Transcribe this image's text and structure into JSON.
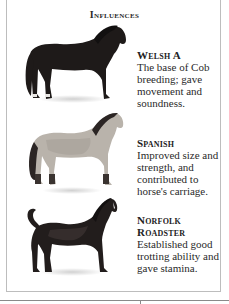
{
  "page": {
    "title": "Influences"
  },
  "influences": [
    {
      "name": "Welsh A",
      "description": "The base of Cob breeding; gave movement and soundness.",
      "coat_color": "#1e1a19"
    },
    {
      "name": "Spanish",
      "description": "Improved size and strength, and contributed to horse's carriage.",
      "coat_color": "#b9b3ab"
    },
    {
      "name": "Norfolk Roadster",
      "description": "Established good trotting ability and gave stamina.",
      "coat_color": "#221d1c"
    }
  ]
}
